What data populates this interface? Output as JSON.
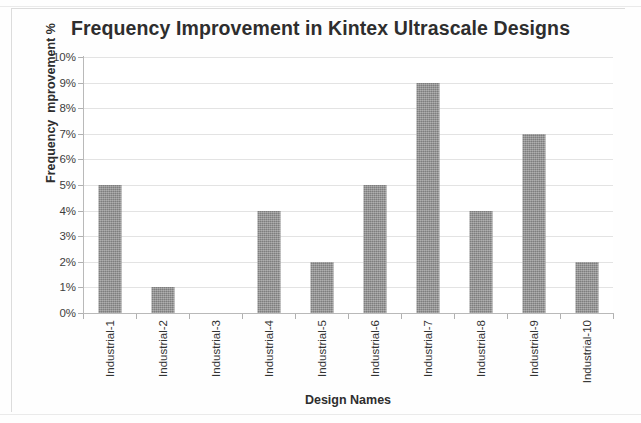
{
  "chart_data": {
    "type": "bar",
    "title": "Frequency Improvement in Kintex Ultrascale Designs",
    "xlabel": "Design Names",
    "ylabel": "Frequency  mprovement %",
    "categories": [
      "Industrial-1",
      "Industrial-2",
      "Industrial-3",
      "Industrial-4",
      "Industrial-5",
      "Industrial-6",
      "Industrial-7",
      "Industrial-8",
      "Industrial-9",
      "Industrial-10"
    ],
    "values": [
      5,
      1,
      0,
      4,
      2,
      5,
      9,
      4,
      7,
      2
    ],
    "value_unit": "%",
    "ylim": [
      0,
      10
    ],
    "ytick_step": 1,
    "ytick_labels": [
      "0%",
      "1%",
      "2%",
      "3%",
      "4%",
      "5%",
      "6%",
      "7%",
      "8%",
      "9%",
      "10%"
    ],
    "grid": true,
    "grid_axis": "y",
    "legend": false,
    "legend_position": "none",
    "bar_color": "#8d8d8d",
    "gridline_color": "#e3e3e3",
    "axis_color": "#b9b9b9",
    "background_color": "#ffffff",
    "series": [
      {
        "name": "Frequency Improvement %",
        "values": [
          5,
          1,
          0,
          4,
          2,
          5,
          9,
          4,
          7,
          2
        ]
      }
    ]
  }
}
